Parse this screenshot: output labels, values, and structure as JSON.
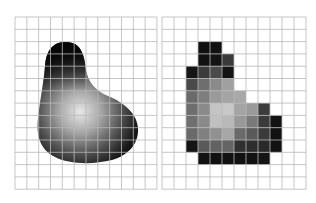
{
  "figure": {
    "left_panel": {
      "label": "continuous-image",
      "grid": {
        "x": 15,
        "y": 17,
        "cols": 12,
        "rows": 14,
        "cell_w": 11.83,
        "cell_h": 12.3,
        "line_color": "#b8b8b8"
      },
      "blob": {
        "highlight_center": [
          80,
          112
        ],
        "dark_color": "#0a0a0a",
        "light_color": "#e8e8e8"
      }
    },
    "right_panel": {
      "label": "sampled-image",
      "grid": {
        "x": 162,
        "y": 17,
        "cols": 12,
        "rows": 14,
        "cell_w": 12,
        "cell_h": 12.3,
        "line_color": "#b8b8b8"
      },
      "pixels": [
        {
          "r": 2,
          "c": 3,
          "v": "#111111"
        },
        {
          "r": 2,
          "c": 4,
          "v": "#111111"
        },
        {
          "r": 3,
          "c": 3,
          "v": "#111111"
        },
        {
          "r": 3,
          "c": 4,
          "v": "#141414"
        },
        {
          "r": 3,
          "c": 5,
          "v": "#3a3a3a"
        },
        {
          "r": 4,
          "c": 2,
          "v": "#151515"
        },
        {
          "r": 4,
          "c": 3,
          "v": "#3c3c3c"
        },
        {
          "r": 4,
          "c": 4,
          "v": "#4a4a4a"
        },
        {
          "r": 4,
          "c": 5,
          "v": "#141414"
        },
        {
          "r": 5,
          "c": 2,
          "v": "#4a4a4a"
        },
        {
          "r": 5,
          "c": 3,
          "v": "#6e6e6e"
        },
        {
          "r": 5,
          "c": 4,
          "v": "#8a8a8a"
        },
        {
          "r": 5,
          "c": 5,
          "v": "#a0a0a0"
        },
        {
          "r": 6,
          "c": 2,
          "v": "#6a6a6a"
        },
        {
          "r": 6,
          "c": 3,
          "v": "#7e7e7e"
        },
        {
          "r": 6,
          "c": 4,
          "v": "#9a9a9a"
        },
        {
          "r": 6,
          "c": 5,
          "v": "#a4a4a4"
        },
        {
          "r": 6,
          "c": 6,
          "v": "#a8a8a8"
        },
        {
          "r": 7,
          "c": 2,
          "v": "#6e6e6e"
        },
        {
          "r": 7,
          "c": 3,
          "v": "#8a8a8a"
        },
        {
          "r": 7,
          "c": 4,
          "v": "#c4c4c4"
        },
        {
          "r": 7,
          "c": 5,
          "v": "#c8c8c8"
        },
        {
          "r": 7,
          "c": 6,
          "v": "#a4a4a4"
        },
        {
          "r": 7,
          "c": 7,
          "v": "#9a9a9a"
        },
        {
          "r": 7,
          "c": 8,
          "v": "#3c3c3c"
        },
        {
          "r": 8,
          "c": 2,
          "v": "#707070"
        },
        {
          "r": 8,
          "c": 3,
          "v": "#8a8a8a"
        },
        {
          "r": 8,
          "c": 4,
          "v": "#c0c0c0"
        },
        {
          "r": 8,
          "c": 5,
          "v": "#b8b8b8"
        },
        {
          "r": 8,
          "c": 6,
          "v": "#989898"
        },
        {
          "r": 8,
          "c": 7,
          "v": "#7a7a7a"
        },
        {
          "r": 8,
          "c": 8,
          "v": "#3a3a3a"
        },
        {
          "r": 8,
          "c": 9,
          "v": "#121212"
        },
        {
          "r": 9,
          "c": 2,
          "v": "#6a6a6a"
        },
        {
          "r": 9,
          "c": 3,
          "v": "#808080"
        },
        {
          "r": 9,
          "c": 4,
          "v": "#909090"
        },
        {
          "r": 9,
          "c": 5,
          "v": "#a6a6a6"
        },
        {
          "r": 9,
          "c": 6,
          "v": "#6a6a6a"
        },
        {
          "r": 9,
          "c": 7,
          "v": "#5a5a5a"
        },
        {
          "r": 9,
          "c": 8,
          "v": "#3a3a3a"
        },
        {
          "r": 9,
          "c": 9,
          "v": "#121212"
        },
        {
          "r": 10,
          "c": 2,
          "v": "#141414"
        },
        {
          "r": 10,
          "c": 3,
          "v": "#5a5a5a"
        },
        {
          "r": 10,
          "c": 4,
          "v": "#626262"
        },
        {
          "r": 10,
          "c": 5,
          "v": "#646464"
        },
        {
          "r": 10,
          "c": 6,
          "v": "#303030"
        },
        {
          "r": 10,
          "c": 7,
          "v": "#2e2e2e"
        },
        {
          "r": 10,
          "c": 8,
          "v": "#2a2a2a"
        },
        {
          "r": 10,
          "c": 9,
          "v": "#121212"
        },
        {
          "r": 11,
          "c": 3,
          "v": "#111111"
        },
        {
          "r": 11,
          "c": 4,
          "v": "#111111"
        },
        {
          "r": 11,
          "c": 5,
          "v": "#121212"
        },
        {
          "r": 11,
          "c": 6,
          "v": "#111111"
        },
        {
          "r": 11,
          "c": 7,
          "v": "#121212"
        },
        {
          "r": 11,
          "c": 8,
          "v": "#141414"
        }
      ]
    }
  }
}
